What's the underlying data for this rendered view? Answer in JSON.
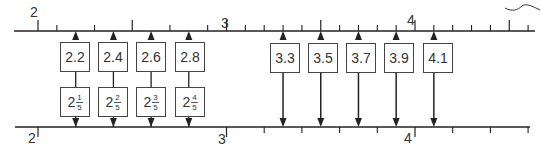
{
  "top_line": {
    "labels": [
      {
        "text": "2",
        "value": 2
      },
      {
        "text": "3",
        "value": 3
      },
      {
        "text": "4",
        "value": 4
      }
    ],
    "decimal_boxes": [
      {
        "text": "2.2",
        "value": 2.2
      },
      {
        "text": "2.4",
        "value": 2.4
      },
      {
        "text": "2.6",
        "value": 2.6
      },
      {
        "text": "2.8",
        "value": 2.8
      },
      {
        "text": "3.3",
        "value": 3.3
      },
      {
        "text": "3.5",
        "value": 3.5
      },
      {
        "text": "3.7",
        "value": 3.7
      },
      {
        "text": "3.9",
        "value": 3.9
      },
      {
        "text": "4.1",
        "value": 4.1
      }
    ]
  },
  "bottom_line": {
    "labels": [
      {
        "text": "2",
        "value": 2
      },
      {
        "text": "3",
        "value": 3
      },
      {
        "text": "4",
        "value": 4
      }
    ],
    "fraction_boxes": [
      {
        "whole": "2",
        "num": "1",
        "den": "5",
        "value": 2.2
      },
      {
        "whole": "2",
        "num": "2",
        "den": "5",
        "value": 2.4
      },
      {
        "whole": "2",
        "num": "3",
        "den": "5",
        "value": 2.6
      },
      {
        "whole": "2",
        "num": "4",
        "den": "5",
        "value": 2.8
      }
    ]
  },
  "colors": {
    "line": "#222222",
    "box_border": "#444444",
    "text": "#333333"
  }
}
